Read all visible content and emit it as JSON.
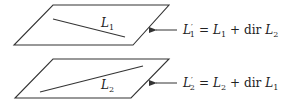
{
  "diagram": {
    "planes": [
      {
        "id": "plane-1",
        "corners": [
          [
            53,
            5
          ],
          [
            169,
            5
          ],
          [
            133,
            45
          ],
          [
            14,
            45
          ]
        ],
        "line": {
          "from": [
            53,
            19
          ],
          "to": [
            125,
            37
          ]
        },
        "line_label": {
          "base": "L",
          "sub": "1",
          "x": 101,
          "y": 27
        },
        "arrow": {
          "from": [
            177,
            30
          ],
          "to": [
            154,
            30
          ]
        },
        "equation": {
          "lhs_base": "L",
          "lhs_prime": "′",
          "lhs_sub": "1",
          "eq": "=",
          "t1_base": "L",
          "t1_sub": "1",
          "plus": "+",
          "op": "dir",
          "t2_base": "L",
          "t2_sub": "2"
        }
      },
      {
        "id": "plane-2",
        "corners": [
          [
            53,
            59
          ],
          [
            169,
            59
          ],
          [
            131,
            98
          ],
          [
            15,
            98
          ]
        ],
        "line": {
          "from": [
            40,
            92
          ],
          "to": [
            143,
            66
          ]
        },
        "line_label": {
          "base": "L",
          "sub": "2",
          "x": 101,
          "y": 89
        },
        "arrow": {
          "from": [
            177,
            83
          ],
          "to": [
            154,
            83
          ]
        },
        "equation": {
          "lhs_base": "L",
          "lhs_prime": "′",
          "lhs_sub": "2",
          "eq": "=",
          "t1_base": "L",
          "t1_sub": "2",
          "plus": "+",
          "op": "dir",
          "t2_base": "L",
          "t2_sub": "1"
        }
      }
    ],
    "colors": {
      "stroke": "#333333",
      "text": "#222222",
      "background": "#ffffff"
    }
  }
}
